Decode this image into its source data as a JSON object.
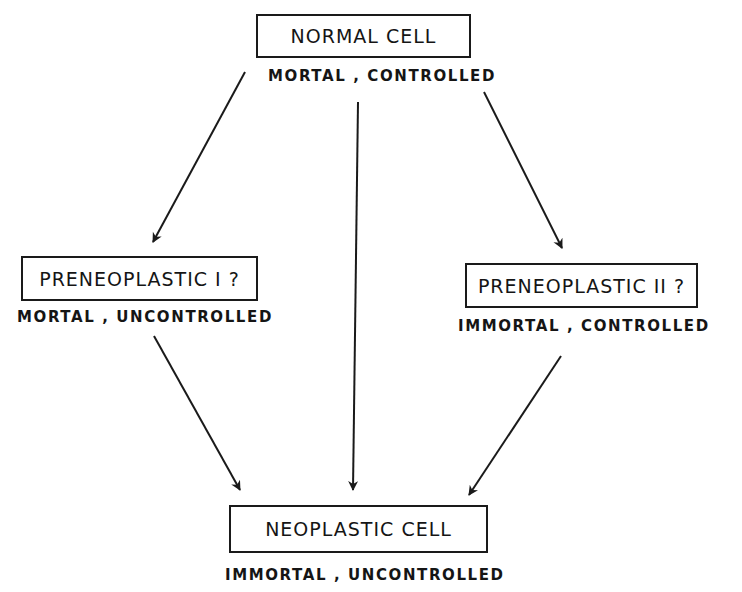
{
  "diagram": {
    "type": "flow",
    "nodes": {
      "normal": {
        "label": "NORMAL CELL",
        "caption": "MORTAL , CONTROLLED"
      },
      "preneoplastic_1": {
        "label": "PRENEOPLASTIC I ?",
        "caption": "MORTAL , UNCONTROLLED"
      },
      "preneoplastic_2": {
        "label": "PRENEOPLASTIC II ?",
        "caption": "IMMORTAL , CONTROLLED"
      },
      "neoplastic": {
        "label": "NEOPLASTIC CELL",
        "caption": "IMMORTAL , UNCONTROLLED"
      }
    },
    "edges": [
      {
        "from": "normal",
        "to": "preneoplastic_1"
      },
      {
        "from": "normal",
        "to": "neoplastic"
      },
      {
        "from": "normal",
        "to": "preneoplastic_2"
      },
      {
        "from": "preneoplastic_1",
        "to": "neoplastic"
      },
      {
        "from": "preneoplastic_2",
        "to": "neoplastic"
      }
    ],
    "colors": {
      "stroke": "#1a1a1a",
      "background": "#ffffff"
    }
  }
}
